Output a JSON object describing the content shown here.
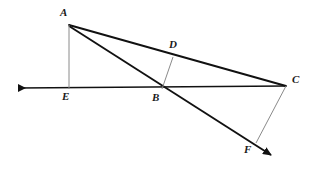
{
  "figure": {
    "kind": "geometry-diagram",
    "title": "",
    "background_color": "#ffffff",
    "stroke_color_thick": "#111111",
    "stroke_color_thin": "#8a8a8a",
    "label_color": "#1a1a1a",
    "width": 314,
    "height": 169
  },
  "points": [
    {
      "id": "A",
      "label": "A",
      "x": 69,
      "y": 25,
      "label_x": 60,
      "label_y": 7
    },
    {
      "id": "D",
      "label": "D",
      "x": 173,
      "y": 57,
      "label_x": 169,
      "label_y": 39
    },
    {
      "id": "C",
      "label": "C",
      "x": 286,
      "y": 86,
      "label_x": 292,
      "label_y": 74
    },
    {
      "id": "E",
      "label": "E",
      "x": 69,
      "y": 88,
      "label_x": 62,
      "label_y": 90
    },
    {
      "id": "B",
      "label": "B",
      "x": 162,
      "y": 88,
      "label_x": 152,
      "label_y": 91
    },
    {
      "id": "F",
      "label": "F",
      "x": 256,
      "y": 143,
      "label_x": 244,
      "label_y": 144
    }
  ],
  "segments": [
    {
      "id": "A-C",
      "from": "A",
      "to": "C",
      "weight": "thick",
      "style": "solid"
    },
    {
      "id": "A-E",
      "from": "A",
      "to": "E",
      "weight": "thin",
      "style": "solid"
    },
    {
      "id": "D-B",
      "from": "D",
      "to": "B",
      "weight": "thin",
      "style": "solid"
    },
    {
      "id": "C-F",
      "from": "C",
      "to": "F",
      "weight": "thin",
      "style": "solid"
    }
  ],
  "rays": [
    {
      "id": "ray-E-left",
      "description": "horizontal line through E, B and C with arrowhead pointing left",
      "weight": "thick",
      "arrow_at": "start",
      "start_x": 12,
      "start_y": 88,
      "end_x": 286,
      "end_y": 86
    },
    {
      "id": "ray-A-F",
      "description": "ray from A through B and F with arrowhead pointing down-right",
      "weight": "thick",
      "arrow_at": "end",
      "start_x": 69,
      "start_y": 26,
      "end_x": 278,
      "end_y": 159
    }
  ],
  "labels": {
    "A": "A",
    "B": "B",
    "C": "C",
    "D": "D",
    "E": "E",
    "F": "F"
  }
}
